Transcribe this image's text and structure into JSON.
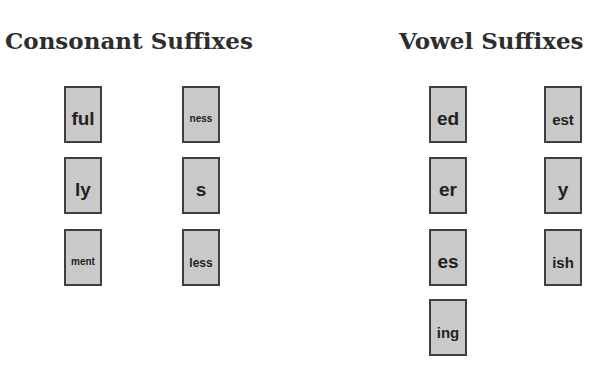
{
  "consonant": {
    "title": "Consonant Suffixes",
    "cards": [
      {
        "label": "ful"
      },
      {
        "label": "ness"
      },
      {
        "label": "ly"
      },
      {
        "label": "s"
      },
      {
        "label": "ment"
      },
      {
        "label": "less"
      }
    ]
  },
  "vowel": {
    "title": "Vowel Suffixes",
    "cards": [
      {
        "label": "ed"
      },
      {
        "label": "est"
      },
      {
        "label": "er"
      },
      {
        "label": "y"
      },
      {
        "label": "es"
      },
      {
        "label": "ish"
      },
      {
        "label": "ing"
      }
    ]
  },
  "colors": {
    "card_fill": "#c9c9c9",
    "card_border": "#3f3f3f",
    "text": "#222222"
  }
}
